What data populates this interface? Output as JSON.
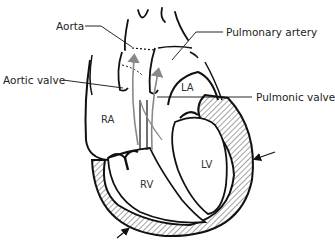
{
  "diagram": {
    "labels": {
      "aorta": "Aorta",
      "pulmonary_artery": "Pulmonary artery",
      "aortic_valve": "Aortic valve",
      "pulmonic_valve": "Pulmonic valve"
    },
    "chambers": {
      "ra": "RA",
      "la": "LA",
      "rv": "RV",
      "lv": "LV"
    },
    "colors": {
      "line": "#111111",
      "hatch": "#555555",
      "flow_arrow": "#888888",
      "background": "#ffffff"
    }
  }
}
